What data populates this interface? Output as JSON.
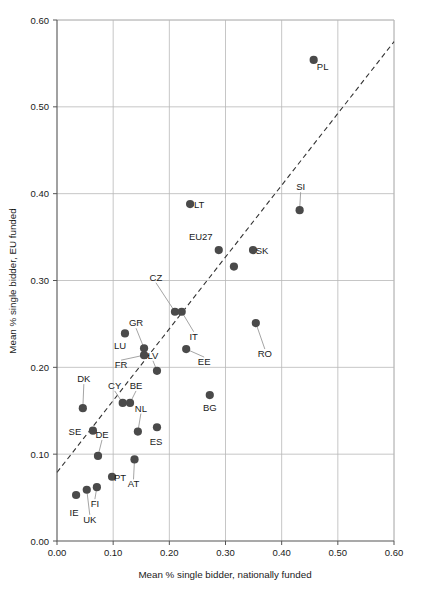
{
  "chart_data": {
    "type": "scatter",
    "title": "",
    "xlabel": "Mean % single bidder, nationally funded",
    "ylabel": "Mean % single bidder, EU funded",
    "xlim": [
      0.0,
      0.6
    ],
    "ylim": [
      0.0,
      0.6
    ],
    "xticks": [
      "0.00",
      "0.10",
      "0.20",
      "0.30",
      "0.40",
      "0.50",
      "0.60"
    ],
    "yticks": [
      "0.00",
      "0.10",
      "0.20",
      "0.30",
      "0.40",
      "0.50",
      "0.60"
    ],
    "grid": true,
    "legend": "none",
    "marker_color": "#4a4a4a",
    "grid_color": "#b8b8b8",
    "trendline": {
      "style": "dashed",
      "color": "#333333",
      "x0": 0.0,
      "y0": 0.079,
      "x1": 0.6,
      "y1": 0.575
    },
    "points": [
      {
        "label": "PL",
        "x": 0.457,
        "y": 0.554,
        "label_dx": 9,
        "label_dy": 10,
        "leader": false
      },
      {
        "label": "SI",
        "x": 0.432,
        "y": 0.381,
        "label_dx": 1,
        "label_dy": -20,
        "leader": true
      },
      {
        "label": "LT",
        "x": 0.237,
        "y": 0.388,
        "label_dx": 9,
        "label_dy": 4,
        "leader": false
      },
      {
        "label": "SK",
        "x": 0.349,
        "y": 0.335,
        "label_dx": 9,
        "label_dy": 4,
        "leader": false
      },
      {
        "label": "EU27",
        "x": 0.288,
        "y": 0.335,
        "label_dx": -18,
        "label_dy": -10,
        "leader": false
      },
      {
        "label": "",
        "x": 0.315,
        "y": 0.316,
        "label_dx": 0,
        "label_dy": 0,
        "leader": false
      },
      {
        "label": "RO",
        "x": 0.354,
        "y": 0.251,
        "label_dx": 9,
        "label_dy": 34,
        "leader": true
      },
      {
        "label": "CZ",
        "x": 0.21,
        "y": 0.264,
        "label_dx": -19,
        "label_dy": -31,
        "leader": true
      },
      {
        "label": "IT",
        "x": 0.222,
        "y": 0.264,
        "label_dx": 12,
        "label_dy": 28,
        "leader": true
      },
      {
        "label": "EE",
        "x": 0.23,
        "y": 0.221,
        "label_dx": 18,
        "label_dy": 16,
        "leader": true
      },
      {
        "label": "LU",
        "x": 0.121,
        "y": 0.239,
        "label_dx": -5,
        "label_dy": 16,
        "leader": false
      },
      {
        "label": "GR",
        "x": 0.155,
        "y": 0.222,
        "label_dx": -8,
        "label_dy": -22,
        "leader": true
      },
      {
        "label": "FR",
        "x": 0.155,
        "y": 0.214,
        "label_dx": -23,
        "label_dy": 13,
        "leader": true
      },
      {
        "label": "LV",
        "x": 0.178,
        "y": 0.196,
        "label_dx": -4,
        "label_dy": -12,
        "leader": true
      },
      {
        "label": "BG",
        "x": 0.272,
        "y": 0.168,
        "label_dx": 0,
        "label_dy": 16,
        "leader": false
      },
      {
        "label": "DK",
        "x": 0.046,
        "y": 0.153,
        "label_dx": 1,
        "label_dy": -26,
        "leader": true
      },
      {
        "label": "CY",
        "x": 0.117,
        "y": 0.159,
        "label_dx": -8,
        "label_dy": -14,
        "leader": true
      },
      {
        "label": "BE",
        "x": 0.13,
        "y": 0.159,
        "label_dx": 6,
        "label_dy": -14,
        "leader": true
      },
      {
        "label": "SE",
        "x": 0.064,
        "y": 0.127,
        "label_dx": -18,
        "label_dy": 4,
        "leader": false
      },
      {
        "label": "NL",
        "x": 0.144,
        "y": 0.126,
        "label_dx": 3,
        "label_dy": -20,
        "leader": true
      },
      {
        "label": "ES",
        "x": 0.178,
        "y": 0.131,
        "label_dx": -1,
        "label_dy": 18,
        "leader": false
      },
      {
        "label": "DE",
        "x": 0.073,
        "y": 0.098,
        "label_dx": 4,
        "label_dy": -18,
        "leader": true
      },
      {
        "label": "PT",
        "x": 0.098,
        "y": 0.074,
        "label_dx": 8,
        "label_dy": 4,
        "leader": false
      },
      {
        "label": "AT",
        "x": 0.138,
        "y": 0.094,
        "label_dx": -1,
        "label_dy": 28,
        "leader": true
      },
      {
        "label": "FI",
        "x": 0.071,
        "y": 0.062,
        "label_dx": -2,
        "label_dy": 20,
        "leader": true
      },
      {
        "label": "UK",
        "x": 0.053,
        "y": 0.059,
        "label_dx": 3,
        "label_dy": 33,
        "leader": true
      },
      {
        "label": "IE",
        "x": 0.034,
        "y": 0.053,
        "label_dx": -2,
        "label_dy": 21,
        "leader": false
      }
    ]
  }
}
